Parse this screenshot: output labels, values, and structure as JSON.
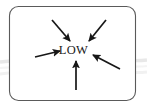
{
  "figure": {
    "name": "low-pressure-convergence-diagram",
    "background_color": "#ffffff",
    "frame": {
      "name": "rounded-frame",
      "stroke_color": "#5a5a5a",
      "fill_color": "#ffffff",
      "corner_radius": 9
    },
    "center_label": {
      "text": "LOW",
      "color": "#1a1a1a"
    },
    "arrow_color": "#171717",
    "arrows": [
      {
        "name": "arrow-top-left",
        "direction": "down-right",
        "label": "",
        "x1": 52,
        "y1": 20,
        "x2": 70,
        "y2": 41
      },
      {
        "name": "arrow-top-right",
        "direction": "down-left",
        "label": "",
        "x1": 106,
        "y1": 20,
        "x2": 89,
        "y2": 41
      },
      {
        "name": "arrow-left",
        "direction": "right",
        "label": "",
        "x1": 35,
        "y1": 57,
        "x2": 60,
        "y2": 51
      },
      {
        "name": "arrow-right",
        "direction": "up-left",
        "label": "",
        "x1": 120,
        "y1": 69,
        "x2": 93,
        "y2": 55
      },
      {
        "name": "arrow-bottom",
        "direction": "up",
        "label": "",
        "x1": 76,
        "y1": 90,
        "x2": 76,
        "y2": 61
      }
    ],
    "background_streaks": [
      {
        "name": "background-streak-upper",
        "color": "#e9e9e9"
      },
      {
        "name": "background-streak-lower",
        "color": "#efefef"
      }
    ]
  }
}
